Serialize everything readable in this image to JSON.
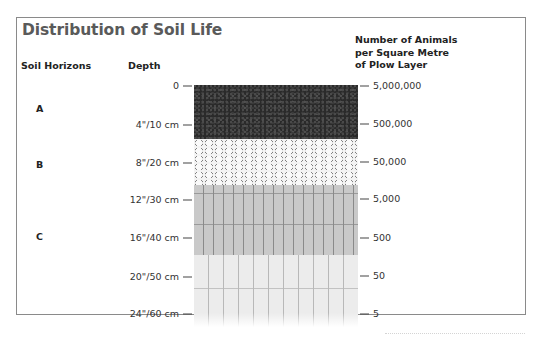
{
  "title": "Distribution of Soil Life",
  "headers": {
    "soil_horizons": "Soil Horizons",
    "depth": "Depth",
    "animals": [
      "Number of Animals",
      "per Square Metre",
      "of Plow Layer"
    ]
  },
  "horizons": [
    {
      "label": "A",
      "y": 109
    },
    {
      "label": "B",
      "y": 165
    },
    {
      "label": "C",
      "y": 237
    }
  ],
  "depth_ticks": [
    {
      "label": "0",
      "y": 85
    },
    {
      "label": "4\"/10 cm",
      "y": 124
    },
    {
      "label": "8\"/20 cm",
      "y": 162
    },
    {
      "label": "12\"/30 cm",
      "y": 199
    },
    {
      "label": "16\"/40 cm",
      "y": 237
    },
    {
      "label": "20\"/50 cm",
      "y": 276
    },
    {
      "label": "24\"/60 cm",
      "y": 313
    }
  ],
  "count_ticks": [
    {
      "label": "5,000,000",
      "y": 85
    },
    {
      "label": "500,000",
      "y": 123
    },
    {
      "label": "50,000",
      "y": 161
    },
    {
      "label": "5,000",
      "y": 198
    },
    {
      "label": "500",
      "y": 237
    },
    {
      "label": "50",
      "y": 275
    },
    {
      "label": "5",
      "y": 313
    }
  ],
  "chart_data": {
    "type": "table",
    "title": "Distribution of Soil Life",
    "columns": [
      "Depth",
      "Number of Animals per Square Metre of Plow Layer"
    ],
    "rows": [
      [
        "0",
        "5,000,000"
      ],
      [
        "4\"/10 cm",
        "500,000"
      ],
      [
        "8\"/20 cm",
        "50,000"
      ],
      [
        "12\"/30 cm",
        "5,000"
      ],
      [
        "16\"/40 cm",
        "500"
      ],
      [
        "20\"/50 cm",
        "50"
      ],
      [
        "24\"/60 cm",
        "5"
      ]
    ],
    "horizons": [
      {
        "name": "A",
        "range": "0 – 4\"/10 cm"
      },
      {
        "name": "B",
        "range": "4\"/10 cm – 12\"/30 cm"
      },
      {
        "name": "C",
        "range": "12\"/30 cm – 24\"/60 cm"
      }
    ]
  }
}
